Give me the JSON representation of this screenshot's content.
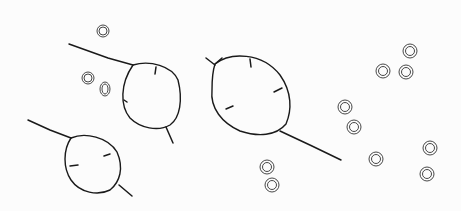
{
  "image": {
    "description": "Ink line sketch of three oval seed pods with stems and scattered small round seeds on white paper",
    "background_color": "#fcfcfc",
    "ink_color": "#1a1a1a",
    "subjects": {
      "pods": [
        {
          "name": "pod-upper-left",
          "cx": 150,
          "cy": 96,
          "rx": 28,
          "ry": 33
        },
        {
          "name": "pod-lower-left",
          "cx": 93,
          "cy": 164,
          "rx": 28,
          "ry": 28
        },
        {
          "name": "pod-center",
          "cx": 250,
          "cy": 100,
          "rx": 40,
          "ry": 42
        }
      ],
      "seeds": [
        {
          "x": 103,
          "y": 31
        },
        {
          "x": 88,
          "y": 78
        },
        {
          "x": 105,
          "y": 89
        },
        {
          "x": 410,
          "y": 51
        },
        {
          "x": 383,
          "y": 71
        },
        {
          "x": 406,
          "y": 72
        },
        {
          "x": 345,
          "y": 107
        },
        {
          "x": 354,
          "y": 127
        },
        {
          "x": 376,
          "y": 159
        },
        {
          "x": 430,
          "y": 148
        },
        {
          "x": 427,
          "y": 174
        },
        {
          "x": 267,
          "y": 167
        },
        {
          "x": 272,
          "y": 185
        }
      ]
    }
  }
}
